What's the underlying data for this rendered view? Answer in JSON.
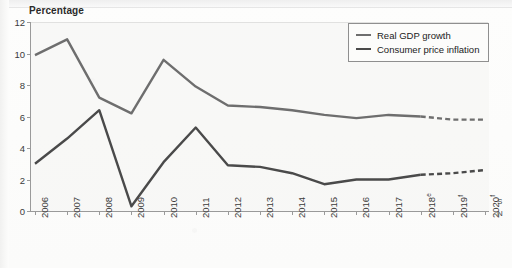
{
  "chart_data": {
    "type": "line",
    "title": "Percentage",
    "xlabel": "",
    "ylabel": "Percentage",
    "ylim": [
      0,
      12
    ],
    "yticks": [
      0,
      2,
      4,
      6,
      8,
      10,
      12
    ],
    "grid": false,
    "legend_position": "top-right-inside",
    "categories": [
      "2006",
      "2007",
      "2008",
      "2009",
      "2010",
      "2011",
      "2012",
      "2013",
      "2014",
      "2015",
      "2016",
      "2017",
      "2018",
      "2019",
      "2020"
    ],
    "tick_labels": [
      "2006",
      "2007",
      "2008",
      "2009",
      "2010",
      "2011",
      "2012",
      "2013",
      "2014",
      "2015",
      "2016",
      "2017",
      "2018",
      "2019",
      "2020"
    ],
    "tick_superscripts": [
      "",
      "",
      "",
      "",
      "",
      "",
      "",
      "",
      "",
      "",
      "",
      "",
      "e",
      "f",
      "f"
    ],
    "forecast_starts_at": "2018",
    "series": [
      {
        "name": "Real GDP growth",
        "color": "#6e6e6e",
        "values": [
          9.9,
          10.9,
          7.2,
          6.2,
          9.6,
          7.9,
          6.7,
          6.6,
          6.4,
          6.1,
          5.9,
          6.1,
          6.0,
          5.8,
          5.8
        ]
      },
      {
        "name": "Consumer price inflation",
        "color": "#4a4a4a",
        "values": [
          3.0,
          4.6,
          6.4,
          0.3,
          3.1,
          5.3,
          2.9,
          2.8,
          2.4,
          1.7,
          2.0,
          2.0,
          2.3,
          2.4,
          2.6
        ]
      }
    ]
  },
  "legend": {
    "items": [
      {
        "label": "Real GDP growth"
      },
      {
        "label": "Consumer price inflation"
      }
    ]
  },
  "source_note": {
    "line1": "S",
    "line2": "N"
  }
}
